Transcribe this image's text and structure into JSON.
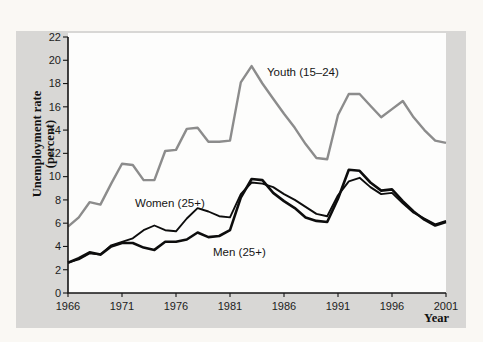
{
  "figure": {
    "y_axis_title_line1": "Unemployment rate",
    "y_axis_title_line2": "(percent)",
    "x_axis_title": "Year"
  },
  "colors": {
    "panel_background": "#d8d7d5",
    "plot_background": "#fdfdfc",
    "youth_line": "#8c8c8c",
    "adult_lines": "#0d0d0d"
  },
  "chart_data": {
    "type": "line",
    "title": "",
    "xlabel": "Year",
    "ylabel": "Unemployment rate (percent)",
    "xlim": [
      1966,
      2001
    ],
    "ylim": [
      0,
      22
    ],
    "grid": false,
    "legend_position": "inline-labels",
    "x_ticks": [
      1966,
      1971,
      1976,
      1981,
      1986,
      1991,
      1996,
      2001
    ],
    "y_ticks": [
      0,
      2,
      4,
      6,
      8,
      10,
      12,
      14,
      16,
      18,
      20,
      22
    ],
    "years": [
      1966,
      1967,
      1968,
      1969,
      1970,
      1971,
      1972,
      1973,
      1974,
      1975,
      1976,
      1977,
      1978,
      1979,
      1980,
      1981,
      1982,
      1983,
      1984,
      1985,
      1986,
      1987,
      1988,
      1989,
      1990,
      1991,
      1992,
      1993,
      1994,
      1995,
      1996,
      1997,
      1998,
      1999,
      2000,
      2001
    ],
    "series": [
      {
        "name": "Youth (15–24)",
        "color": "#8c8c8c",
        "stroke_width": 2.4,
        "values": [
          5.7,
          6.5,
          7.8,
          7.6,
          9.4,
          11.1,
          11.0,
          9.7,
          9.7,
          12.2,
          12.3,
          14.1,
          14.2,
          13.0,
          13.0,
          13.1,
          18.1,
          19.5,
          18.0,
          16.7,
          15.4,
          14.2,
          12.8,
          11.6,
          11.5,
          15.3,
          17.1,
          17.1,
          16.1,
          15.1,
          15.8,
          16.5,
          15.1,
          14.0,
          13.1,
          12.9
        ]
      },
      {
        "name": "Women (25+)",
        "color": "#0d0d0d",
        "stroke_width": 1.9,
        "values": [
          2.6,
          2.9,
          3.4,
          3.3,
          4.1,
          4.4,
          4.7,
          5.4,
          5.8,
          5.4,
          5.3,
          6.4,
          7.3,
          7.0,
          6.6,
          6.5,
          8.5,
          9.5,
          9.4,
          9.1,
          8.5,
          8.0,
          7.4,
          6.8,
          6.6,
          8.4,
          9.6,
          9.9,
          9.1,
          8.5,
          8.6,
          7.7,
          6.9,
          6.4,
          5.9,
          6.2
        ]
      },
      {
        "name": "Men (25+)",
        "color": "#0d0d0d",
        "stroke_width": 2.6,
        "values": [
          2.6,
          3.0,
          3.5,
          3.3,
          4.0,
          4.3,
          4.3,
          3.9,
          3.7,
          4.4,
          4.4,
          4.6,
          5.2,
          4.8,
          4.9,
          5.4,
          8.2,
          9.8,
          9.7,
          8.6,
          7.9,
          7.3,
          6.5,
          6.2,
          6.1,
          8.1,
          10.6,
          10.5,
          9.5,
          8.8,
          8.9,
          7.9,
          7.0,
          6.3,
          5.8,
          6.1
        ]
      }
    ]
  }
}
